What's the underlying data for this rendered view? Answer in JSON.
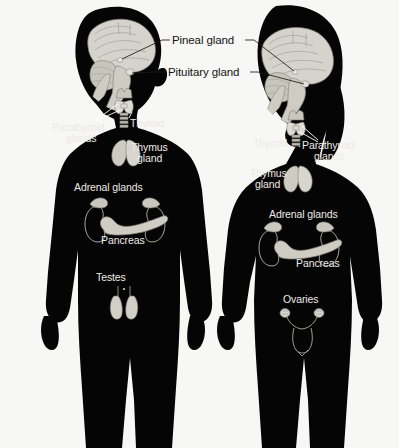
{
  "diagram": {
    "background_color": "#f7f7f5",
    "silhouette_color": "#050505",
    "organ_color": "#cfcdc6",
    "leader_line_color_light": "#ffffff",
    "leader_line_color_dark": "#1a1a1a",
    "width": 399,
    "height": 448
  },
  "shared_labels": [
    {
      "id": "pineal",
      "text": "Pineal gland",
      "x": 172,
      "y": 34,
      "color": "#141414"
    },
    {
      "id": "pituitary",
      "text": "Pituitary gland",
      "x": 168,
      "y": 66,
      "color": "#141414"
    }
  ],
  "male_figure": {
    "name": "male-body-silhouette",
    "labels": [
      {
        "id": "male-parathyroid",
        "line1": "Parathyroid",
        "line2": "glands",
        "x": 52,
        "y": 122,
        "align": "left"
      },
      {
        "id": "male-thyroid",
        "line1": "Thyroid",
        "line2": "",
        "x": 130,
        "y": 118,
        "align": "left"
      },
      {
        "id": "male-thymus",
        "line1": "Thymus",
        "line2": "gland",
        "x": 131,
        "y": 142,
        "align": "left"
      },
      {
        "id": "male-adrenal",
        "line1": "Adrenal glands",
        "line2": "",
        "x": 74,
        "y": 182,
        "align": "left"
      },
      {
        "id": "male-pancreas",
        "line1": "Pancreas",
        "line2": "",
        "x": 101,
        "y": 235,
        "align": "left"
      },
      {
        "id": "male-testes",
        "line1": "Testes",
        "line2": "",
        "x": 96,
        "y": 272,
        "align": "left"
      }
    ],
    "organs": [
      "brain",
      "thyroid",
      "thymus",
      "kidneys",
      "adrenal-glands",
      "pancreas",
      "testes"
    ]
  },
  "female_figure": {
    "name": "female-body-silhouette",
    "labels": [
      {
        "id": "female-thyroid",
        "line1": "Thyroid",
        "line2": "",
        "x": 253,
        "y": 138,
        "align": "left"
      },
      {
        "id": "female-parathyroid",
        "line1": "Parathyroid",
        "line2": "glands",
        "x": 302,
        "y": 140,
        "align": "left"
      },
      {
        "id": "female-thymus",
        "line1": "Thymus",
        "line2": "gland",
        "x": 250,
        "y": 168,
        "align": "left"
      },
      {
        "id": "female-adrenal",
        "line1": "Adrenal glands",
        "line2": "",
        "x": 269,
        "y": 209,
        "align": "left"
      },
      {
        "id": "female-pancreas",
        "line1": "Pancreas",
        "line2": "",
        "x": 296,
        "y": 258,
        "align": "left"
      },
      {
        "id": "female-ovaries",
        "line1": "Ovaries",
        "line2": "",
        "x": 283,
        "y": 294,
        "align": "left"
      }
    ],
    "organs": [
      "brain",
      "thyroid",
      "thymus",
      "kidneys",
      "adrenal-glands",
      "pancreas",
      "ovaries",
      "uterus"
    ]
  }
}
